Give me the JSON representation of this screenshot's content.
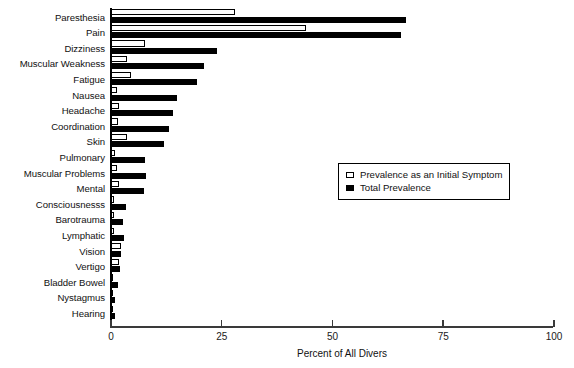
{
  "chart_data": {
    "type": "bar",
    "orientation": "horizontal",
    "title": "",
    "xlabel": "Percent of All Divers",
    "ylabel": "",
    "xlim": [
      0,
      100
    ],
    "xticks": [
      0,
      25,
      50,
      75,
      100
    ],
    "xtick_labels": [
      "0",
      "25",
      "50",
      "75",
      "100"
    ],
    "grid": false,
    "legend_position": "center-right",
    "categories": [
      "Paresthesia",
      "Pain",
      "Dizziness",
      "Muscular Weakness",
      "Fatigue",
      "Nausea",
      "Headache",
      "Coordination",
      "Skin",
      "Pulmonary",
      "Muscular Problems",
      "Mental",
      "Consciousnesss",
      "Barotrauma",
      "Lymphatic",
      "Vision",
      "Vertigo",
      "Bladder Bowel",
      "Nystagmus",
      "Hearing"
    ],
    "series": [
      {
        "name": "Prevalence as an Initial Symptom",
        "style": "open",
        "color": "#ffffff",
        "edgecolor": "#000000",
        "values": [
          28.0,
          44.0,
          7.7,
          3.6,
          4.5,
          1.4,
          1.8,
          1.6,
          3.6,
          0.9,
          1.4,
          1.7,
          0.7,
          0.6,
          0.6,
          2.3,
          1.8,
          0.4,
          0.4,
          0.4
        ]
      },
      {
        "name": "Total Prevalence",
        "style": "filled",
        "color": "#000000",
        "edgecolor": "#000000",
        "values": [
          66.5,
          65.5,
          24.0,
          21.0,
          19.5,
          15.0,
          14.0,
          13.0,
          12.0,
          7.7,
          8.0,
          7.5,
          3.4,
          2.8,
          3.0,
          2.3,
          2.0,
          1.5,
          0.9,
          0.8
        ]
      }
    ]
  },
  "legend": {
    "items": [
      {
        "label": "Prevalence as an Initial Symptom",
        "style": "open"
      },
      {
        "label": "Total Prevalence",
        "style": "filled"
      }
    ]
  }
}
